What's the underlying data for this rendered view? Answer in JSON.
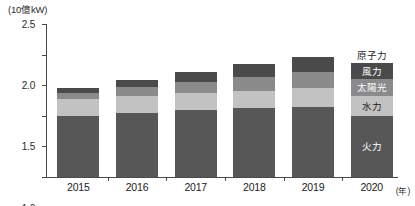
{
  "chart_data": {
    "type": "bar",
    "stacked": true,
    "title": "",
    "unit_label": "(10億kW)",
    "xlabel": "(年)",
    "ylabel": "",
    "ylim": [
      0.0,
      2.5
    ],
    "ytick_labels": [
      "0.0",
      "0.5",
      "1.0",
      "1.5",
      "2.0",
      "2.5"
    ],
    "ytick_values": [
      0.0,
      0.5,
      1.0,
      1.5,
      2.0,
      2.5
    ],
    "grid": false,
    "legend_position": "overlaid-on-last-bar",
    "categories": [
      "2015",
      "2016",
      "2017",
      "2018",
      "2019",
      "2020"
    ],
    "series": [
      {
        "name": "火力",
        "name_en": "thermal",
        "color": "#575757",
        "values": [
          1.0,
          1.05,
          1.1,
          1.12,
          1.15,
          1.0
        ]
      },
      {
        "name": "水力",
        "name_en": "hydro",
        "color": "#c2c2c2",
        "values": [
          0.27,
          0.28,
          0.28,
          0.29,
          0.3,
          0.33
        ]
      },
      {
        "name": "太陽光",
        "name_en": "solar",
        "color": "#8a8a8a",
        "values": [
          0.1,
          0.14,
          0.18,
          0.23,
          0.26,
          0.27
        ]
      },
      {
        "name": "風力",
        "name_en": "wind",
        "color": "#4a4a4a",
        "values": [
          0.09,
          0.12,
          0.16,
          0.21,
          0.25,
          0.27
        ]
      }
    ],
    "totals": [
      1.46,
      1.59,
      1.72,
      1.85,
      1.96,
      1.87
    ],
    "annotations": [
      {
        "text": "原子力",
        "text_en": "nuclear",
        "target": "2020",
        "placement": "above-bar"
      }
    ]
  }
}
